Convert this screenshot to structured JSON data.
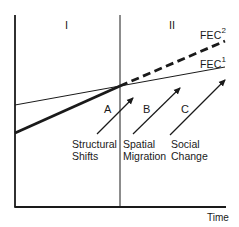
{
  "diagram": {
    "type": "conceptual line diagram",
    "regions": [
      {
        "label": "I"
      },
      {
        "label": "II"
      }
    ],
    "curves": [
      {
        "label": "FEC",
        "superscript": "2",
        "style": "dashed-thick"
      },
      {
        "label": "FEC",
        "superscript": "1",
        "style": "solid-thin"
      }
    ],
    "arrows": [
      {
        "letter": "A",
        "caption_line1": "Structural",
        "caption_line2": "Shifts"
      },
      {
        "letter": "B",
        "caption_line1": "Spatial",
        "caption_line2": "Migration"
      },
      {
        "letter": "C",
        "caption_line1": "Social",
        "caption_line2": "Change"
      }
    ],
    "x_axis_label": "Time",
    "colors": {
      "ink": "#1a1a1a",
      "background": "#ffffff"
    }
  }
}
